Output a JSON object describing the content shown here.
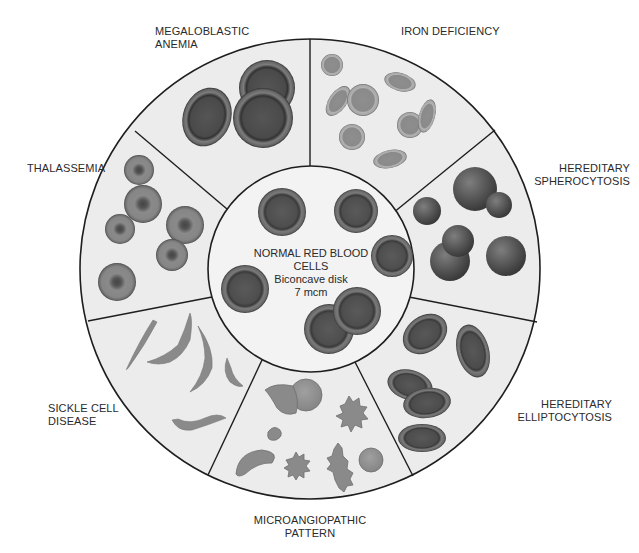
{
  "diagram": {
    "center": {
      "title_line1": "NORMAL RED BLOOD",
      "title_line2": "CELLS",
      "subtitle": "Biconcave disk",
      "size": "7 mcm"
    },
    "segments": [
      {
        "id": "megaloblastic",
        "line1": "MEGALOBLASTIC",
        "line2": "ANEMIA"
      },
      {
        "id": "iron",
        "line1": "IRON DEFICIENCY",
        "line2": ""
      },
      {
        "id": "spherocytosis",
        "line1": "HEREDITARY",
        "line2": "SPHEROCYTOSIS"
      },
      {
        "id": "elliptocytosis",
        "line1": "HEREDITARY",
        "line2": "ELLIPTOCYTOSIS"
      },
      {
        "id": "microangiopathic",
        "line1": "MICROANGIOPATHIC",
        "line2": "PATTERN"
      },
      {
        "id": "sickle",
        "line1": "SICKLE CELL",
        "line2": "DISEASE"
      },
      {
        "id": "thalassemia",
        "line1": "THALASSEMIA",
        "line2": ""
      }
    ],
    "colors": {
      "panel_fill": "#ececec",
      "center_fill": "#f4f4f4",
      "outline": "#1e1e1e",
      "cell_dark": "#4a4a4a",
      "cell_mid": "#7a7a7a",
      "cell_light": "#9a9a9a"
    }
  }
}
